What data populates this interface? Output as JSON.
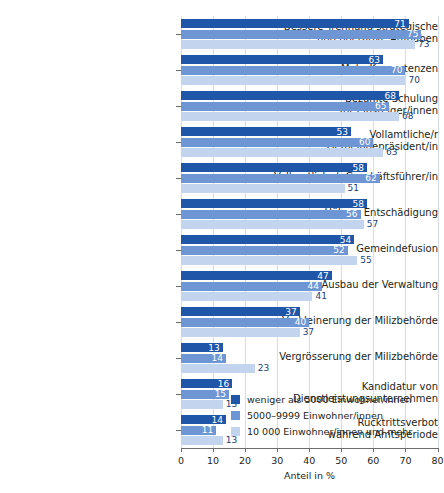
{
  "title": "",
  "chart_data": {
    "type": "bar",
    "orientation": "horizontal",
    "title": "",
    "xlabel": "Anteil in %",
    "ylabel": "",
    "xlim": [
      0,
      80
    ],
    "xticks": [
      0,
      10,
      20,
      30,
      40,
      50,
      60,
      70,
      80
    ],
    "grid": true,
    "legend_position": "inside-bottom-right",
    "categories": [
      "Bessere Trennung strategische\nund operative Aufgaben",
      "Mehr Kompetenzen",
      "Bezahlte Schulung\nfür Einsteiger/innen",
      "Vollamtliche/r\nGemeindepräsident/in",
      "Vollamtliche/r Geschäftsführer/in",
      "Höhere Entschädigung",
      "Gemeindefusion",
      "Ausbau der Verwaltung",
      "Verkleinerung der Milizbehörde",
      "Vergrösserung der Milizbehörde",
      "Kandidatur von\nDienstleistungsunternehmen",
      "Rücktrittsverbot\nwährend Amtsperiode"
    ],
    "series": [
      {
        "name": "weniger als 5000 Einwohner/innen",
        "color": "#1f56a8",
        "values": [
          71,
          63,
          68,
          53,
          58,
          58,
          54,
          47,
          37,
          13,
          16,
          14
        ]
      },
      {
        "name": "5000–9999 Einwohner/innen",
        "color": "#6e96d4",
        "values": [
          75,
          70,
          65,
          60,
          62,
          56,
          52,
          44,
          40,
          14,
          15,
          11
        ]
      },
      {
        "name": "10 000 Einwohner/innen und mehr",
        "color": "#c3d5ee",
        "values": [
          73,
          70,
          68,
          63,
          51,
          57,
          55,
          41,
          37,
          23,
          13,
          13
        ]
      }
    ]
  },
  "legend": {
    "items": [
      "weniger als 5000 Einwohner/innen",
      "5000–9999 Einwohner/innen",
      "10 000 Einwohner/innen und mehr"
    ]
  },
  "colors": {
    "series_0": "#1f56a8",
    "series_1": "#6e96d4",
    "series_2": "#c3d5ee",
    "grid": "#d7dde8",
    "axis": "#6d6d70",
    "text": "#231f20"
  }
}
